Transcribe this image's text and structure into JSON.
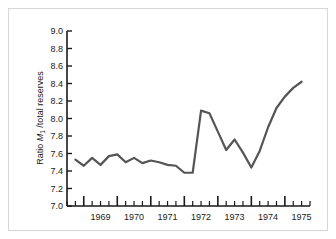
{
  "figure": {
    "background_color": "#ffffff",
    "border_color": "#d6d6d6",
    "axis_color": "#1a1a1a",
    "line_color": "#555555"
  },
  "chart_data": {
    "type": "line",
    "title": "",
    "subtitle": "",
    "xlabel": "",
    "ylabel": "Ratio M1 /total reserves",
    "ylabel_parts": {
      "prefix": "Ratio ",
      "symbol": "M",
      "subscript": "1",
      "suffix": " /total reserves"
    },
    "grid": false,
    "legend": null,
    "ylim": [
      7.0,
      9.0
    ],
    "ytick_step": 0.2,
    "ytick_labels": [
      "7.0",
      "7.2",
      "7.4",
      "7.6",
      "7.8",
      "8.0",
      "8.2",
      "8.4",
      "8.6",
      "8.8",
      "9.0"
    ],
    "ytick_values": [
      7.0,
      7.2,
      7.4,
      7.6,
      7.8,
      8.0,
      8.2,
      8.4,
      8.6,
      8.8,
      9.0
    ],
    "xlim": [
      1968.5,
      1975.75
    ],
    "xtick_labels": [
      "1969",
      "1970",
      "1971",
      "1972",
      "1973",
      "1974",
      "1975"
    ],
    "xtick_values": [
      1969,
      1970,
      1971,
      1972,
      1973,
      1974,
      1975
    ],
    "x_minor_per_major": 4,
    "x_unit": "quarter",
    "series": [
      {
        "name": "Ratio M1 / total reserves",
        "color": "#555555",
        "line_width": 2.2,
        "x": [
          1968.75,
          1969.0,
          1969.25,
          1969.5,
          1969.75,
          1970.0,
          1970.25,
          1970.5,
          1970.75,
          1971.0,
          1971.25,
          1971.5,
          1971.75,
          1972.0,
          1972.25,
          1972.5,
          1972.75,
          1973.0,
          1973.25,
          1973.5,
          1973.75,
          1974.0,
          1974.25,
          1974.5,
          1974.75,
          1975.0,
          1975.25,
          1975.5
        ],
        "values": [
          7.53,
          7.46,
          7.55,
          7.47,
          7.57,
          7.59,
          7.5,
          7.55,
          7.49,
          7.52,
          7.5,
          7.47,
          7.46,
          7.38,
          7.38,
          8.09,
          8.06,
          7.85,
          7.64,
          7.76,
          7.61,
          7.44,
          7.63,
          7.9,
          8.12,
          8.25,
          8.35,
          8.42
        ]
      }
    ],
    "annotations": []
  }
}
